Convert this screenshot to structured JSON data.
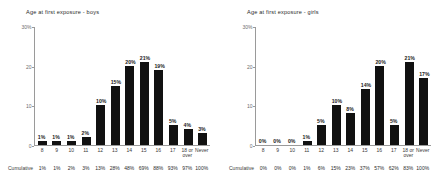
{
  "charts": [
    {
      "key": "boys",
      "title": "Age at first exposure - boys",
      "cumulative_label": "Cumulative"
    },
    {
      "key": "girls",
      "title": "Age at first exposure - girls",
      "cumulative_label": "Cumulative"
    }
  ],
  "chart_data": [
    {
      "type": "bar",
      "title": "Age at first exposure - boys",
      "xlabel": "",
      "ylabel": "",
      "ylim": [
        0,
        30
      ],
      "yticks": [
        0,
        10,
        20,
        30
      ],
      "ytick_labels": [
        "0",
        "10",
        "20",
        "30%"
      ],
      "grid": false,
      "legend": "none",
      "categories": [
        "8",
        "9",
        "10",
        "11",
        "12",
        "13",
        "14",
        "15",
        "16",
        "17",
        "18 or\nover",
        "Never"
      ],
      "values": [
        1,
        1,
        1,
        2,
        10,
        15,
        20,
        21,
        19,
        5,
        4,
        3
      ],
      "data_labels": [
        "1%",
        "1%",
        "1%",
        "2%",
        "10%",
        "15%",
        "20%",
        "21%",
        "19%",
        "5%",
        "4%",
        "3%"
      ],
      "annotations": {
        "row_label": "Cumulative",
        "row_values": [
          "1%",
          "1%",
          "2%",
          "3%",
          "13%",
          "28%",
          "48%",
          "69%",
          "88%",
          "93%",
          "97%",
          "100%"
        ]
      },
      "bar_color": "#111111"
    },
    {
      "type": "bar",
      "title": "Age at first exposure - girls",
      "xlabel": "",
      "ylabel": "",
      "ylim": [
        0,
        30
      ],
      "yticks": [
        0,
        10,
        20,
        30
      ],
      "ytick_labels": [
        "0",
        "10",
        "20",
        "30%"
      ],
      "grid": false,
      "legend": "none",
      "categories": [
        "8",
        "9",
        "10",
        "11",
        "12",
        "13",
        "14",
        "15",
        "16",
        "17",
        "18 or\nover",
        "Never"
      ],
      "values": [
        0,
        0,
        0,
        1,
        5,
        10,
        8,
        14,
        20,
        5,
        21,
        17
      ],
      "data_labels": [
        "0%",
        "0%",
        "0%",
        "1%",
        "5%",
        "10%",
        "8%",
        "14%",
        "20%",
        "5%",
        "21%",
        "17%"
      ],
      "annotations": {
        "row_label": "Cumulative",
        "row_values": [
          "0%",
          "0%",
          "0%",
          "1%",
          "6%",
          "15%",
          "23%",
          "37%",
          "57%",
          "62%",
          "83%",
          "100%"
        ]
      },
      "bar_color": "#111111"
    }
  ]
}
